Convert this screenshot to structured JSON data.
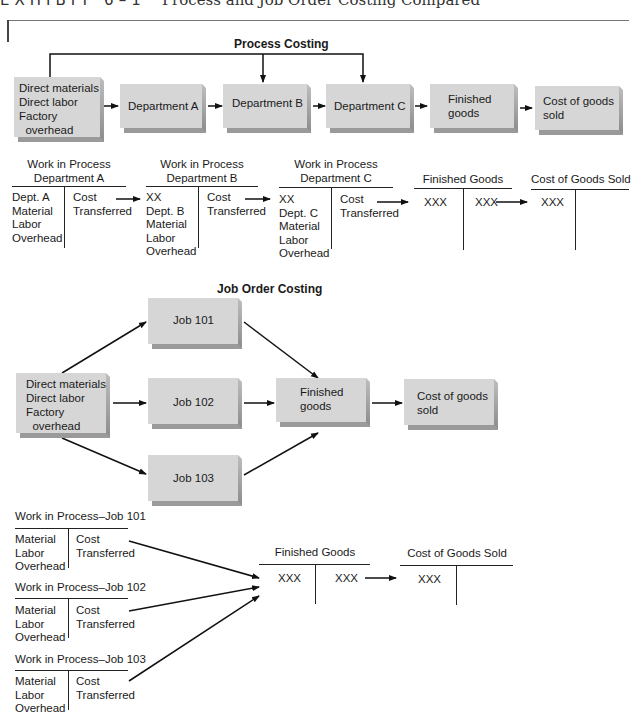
{
  "header": {
    "exhibit_label": "EXHIBIT 6–1",
    "title": "Process and Job Order Costing Compared"
  },
  "process_costing": {
    "title": "Process Costing",
    "boxes": {
      "inputs": [
        "Direct materials",
        "Direct labor",
        "Factory",
        "  overhead"
      ],
      "dept_a": "Department A",
      "dept_b": "Department B",
      "dept_c": "Department C",
      "finished_goods": [
        "Finished",
        "goods"
      ],
      "cogs": [
        "Cost of goods",
        "sold"
      ]
    },
    "t_accounts": [
      {
        "title": [
          "Work in Process",
          "Department A"
        ],
        "debit": [
          "Dept. A",
          "Material",
          "Labor",
          "Overhead"
        ],
        "credit": [
          "Cost",
          "Transferred"
        ]
      },
      {
        "title": [
          "Work in Process",
          "Department B"
        ],
        "debit": [
          "XX",
          "Dept. B",
          "Material",
          "Labor",
          "Overhead"
        ],
        "credit": [
          "Cost",
          "Transferred"
        ]
      },
      {
        "title": [
          "Work in Process",
          "Department C"
        ],
        "debit": [
          "XX",
          "Dept. C",
          "Material",
          "Labor",
          "Overhead"
        ],
        "credit": [
          "Cost",
          "Transferred"
        ]
      },
      {
        "title": [
          "Finished Goods"
        ],
        "debit": [
          "XXX"
        ],
        "credit": [
          "XXX"
        ]
      },
      {
        "title": [
          "Cost of Goods Sold"
        ],
        "debit": [
          "XXX"
        ],
        "credit": []
      }
    ]
  },
  "job_order_costing": {
    "title": "Job Order Costing",
    "boxes": {
      "inputs": [
        "Direct materials",
        "Direct labor",
        "Factory",
        "  overhead"
      ],
      "job_101": "Job 101",
      "job_102": "Job 102",
      "job_103": "Job 103",
      "finished_goods": [
        "Finished",
        "goods"
      ],
      "cogs": [
        "Cost of goods",
        "sold"
      ]
    },
    "t_accounts": [
      {
        "title": [
          "Work in Process–Job 101"
        ],
        "debit": [
          "Material",
          "Labor",
          "Overhead"
        ],
        "credit": [
          "Cost",
          "Transferred"
        ]
      },
      {
        "title": [
          "Work in Process–Job 102"
        ],
        "debit": [
          "Material",
          "Labor",
          "Overhead"
        ],
        "credit": [
          "Cost",
          "Transferred"
        ]
      },
      {
        "title": [
          "Work in Process–Job 103"
        ],
        "debit": [
          "Material",
          "Labor",
          "Overhead"
        ],
        "credit": [
          "Cost",
          "Transferred"
        ]
      },
      {
        "title": [
          "Finished Goods"
        ],
        "debit": [
          "XXX"
        ],
        "credit": [
          "XXX"
        ]
      },
      {
        "title": [
          "Cost of Goods Sold"
        ],
        "debit": [
          "XXX"
        ],
        "credit": []
      }
    ]
  },
  "colors": {
    "box_fill": "#d6d6d6",
    "box_shadow": "#9a9a9a",
    "line": "#222222"
  }
}
